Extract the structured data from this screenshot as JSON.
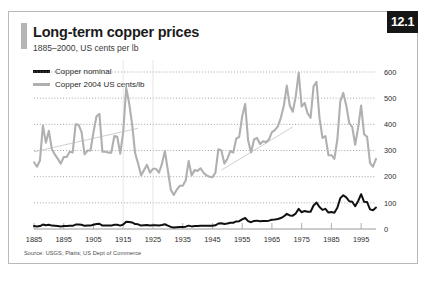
{
  "figure": {
    "number": "12.1",
    "title": "Long-term copper prices",
    "subtitle": "1885–2000, US cents per lb",
    "source": "Source: USGS; Platts; US Dept of Commerce"
  },
  "colors": {
    "nominal": "#111111",
    "real": "#b0b0b0",
    "trend": "#c9c9c9",
    "grid": "#8d8d8d",
    "frame": "#b9b9b9",
    "badge_bg": "#161616",
    "badge_text": "#ffffff",
    "accent_bar": "#b5b5b5"
  },
  "chart_data": {
    "type": "line",
    "title": "Long-term copper prices",
    "subtitle": "1885–2000, US cents per lb",
    "xlabel": "",
    "ylabel": "US cents per lb",
    "xlim": [
      1885,
      2000
    ],
    "ylim": [
      0,
      600
    ],
    "yticks": [
      0,
      100,
      200,
      300,
      400,
      500,
      600
    ],
    "xticks": [
      1885,
      1895,
      1905,
      1915,
      1925,
      1935,
      1945,
      1955,
      1965,
      1975,
      1985,
      1995
    ],
    "grid": true,
    "grid_style": "dotted-horizontal",
    "legend_position": "top-left",
    "legend": [
      "Copper nominal",
      "Copper 2004 US cents/lb"
    ],
    "series": [
      {
        "name": "Copper nominal",
        "color": "#111111",
        "x": [
          1885,
          1886,
          1887,
          1888,
          1889,
          1890,
          1891,
          1892,
          1893,
          1894,
          1895,
          1896,
          1897,
          1898,
          1899,
          1900,
          1901,
          1902,
          1903,
          1904,
          1905,
          1906,
          1907,
          1908,
          1909,
          1910,
          1911,
          1912,
          1913,
          1914,
          1915,
          1916,
          1917,
          1918,
          1919,
          1920,
          1921,
          1922,
          1923,
          1924,
          1925,
          1926,
          1927,
          1928,
          1929,
          1930,
          1931,
          1932,
          1933,
          1934,
          1935,
          1936,
          1937,
          1938,
          1939,
          1940,
          1941,
          1942,
          1943,
          1944,
          1945,
          1946,
          1947,
          1948,
          1949,
          1950,
          1951,
          1952,
          1953,
          1954,
          1955,
          1956,
          1957,
          1958,
          1959,
          1960,
          1961,
          1962,
          1963,
          1964,
          1965,
          1966,
          1967,
          1968,
          1969,
          1970,
          1971,
          1972,
          1973,
          1974,
          1975,
          1976,
          1977,
          1978,
          1979,
          1980,
          1981,
          1982,
          1983,
          1984,
          1985,
          1986,
          1987,
          1988,
          1989,
          1990,
          1991,
          1992,
          1993,
          1994,
          1995,
          1996,
          1997,
          1998,
          1999,
          2000
        ],
        "values": [
          11,
          10,
          11,
          17,
          14,
          16,
          13,
          12,
          11,
          10,
          11,
          11,
          12,
          12,
          17,
          17,
          16,
          12,
          13,
          13,
          16,
          19,
          20,
          13,
          13,
          13,
          13,
          16,
          16,
          13,
          17,
          28,
          27,
          25,
          19,
          18,
          13,
          14,
          15,
          13,
          14,
          14,
          13,
          15,
          18,
          13,
          8,
          6,
          7,
          8,
          8,
          9,
          13,
          10,
          11,
          11,
          12,
          12,
          12,
          12,
          12,
          14,
          21,
          22,
          19,
          21,
          24,
          24,
          29,
          30,
          37,
          42,
          30,
          26,
          31,
          32,
          30,
          31,
          31,
          32,
          35,
          36,
          38,
          42,
          48,
          58,
          52,
          51,
          59,
          77,
          64,
          69,
          66,
          66,
          90,
          101,
          84,
          73,
          77,
          63,
          65,
          62,
          81,
          118,
          129,
          121,
          106,
          104,
          87,
          107,
          133,
          104,
          103,
          75,
          72,
          82
        ]
      },
      {
        "name": "Copper 2004 US cents/lb",
        "color": "#b0b0b0",
        "x": [
          1885,
          1886,
          1887,
          1888,
          1889,
          1890,
          1891,
          1892,
          1893,
          1894,
          1895,
          1896,
          1897,
          1898,
          1899,
          1900,
          1901,
          1902,
          1903,
          1904,
          1905,
          1906,
          1907,
          1908,
          1909,
          1910,
          1911,
          1912,
          1913,
          1914,
          1915,
          1916,
          1917,
          1918,
          1919,
          1920,
          1921,
          1922,
          1923,
          1924,
          1925,
          1926,
          1927,
          1928,
          1929,
          1930,
          1931,
          1932,
          1933,
          1934,
          1935,
          1936,
          1937,
          1938,
          1939,
          1940,
          1941,
          1942,
          1943,
          1944,
          1945,
          1946,
          1947,
          1948,
          1949,
          1950,
          1951,
          1952,
          1953,
          1954,
          1955,
          1956,
          1957,
          1958,
          1959,
          1960,
          1961,
          1962,
          1963,
          1964,
          1965,
          1966,
          1967,
          1968,
          1969,
          1970,
          1971,
          1972,
          1973,
          1974,
          1975,
          1976,
          1977,
          1978,
          1979,
          1980,
          1981,
          1982,
          1983,
          1984,
          1985,
          1986,
          1987,
          1988,
          1989,
          1990,
          1991,
          1992,
          1993,
          1994,
          1995,
          1996,
          1997,
          1998,
          1999,
          2000
        ],
        "values": [
          255,
          238,
          262,
          395,
          330,
          375,
          305,
          285,
          268,
          250,
          275,
          275,
          295,
          292,
          400,
          398,
          370,
          285,
          300,
          300,
          370,
          430,
          440,
          295,
          295,
          292,
          292,
          355,
          352,
          288,
          370,
          540,
          480,
          400,
          290,
          250,
          205,
          225,
          245,
          215,
          230,
          230,
          215,
          248,
          298,
          225,
          150,
          130,
          150,
          165,
          165,
          185,
          260,
          205,
          225,
          222,
          232,
          215,
          205,
          200,
          198,
          215,
          305,
          300,
          250,
          268,
          298,
          292,
          345,
          352,
          430,
          478,
          338,
          292,
          342,
          348,
          325,
          335,
          332,
          342,
          370,
          378,
          392,
          425,
          470,
          548,
          472,
          448,
          505,
          598,
          468,
          482,
          442,
          425,
          545,
          562,
          425,
          348,
          355,
          282,
          282,
          268,
          342,
          488,
          520,
          472,
          405,
          390,
          322,
          388,
          472,
          362,
          352,
          252,
          238,
          268
        ]
      }
    ],
    "trend_lines": [
      {
        "name": "trend-early",
        "x_start": 1885,
        "y_start": 295,
        "x_end": 1920,
        "y_end": 385
      },
      {
        "name": "trend-late",
        "x_start": 1948,
        "y_start": 225,
        "x_end": 1972,
        "y_end": 390
      }
    ]
  }
}
